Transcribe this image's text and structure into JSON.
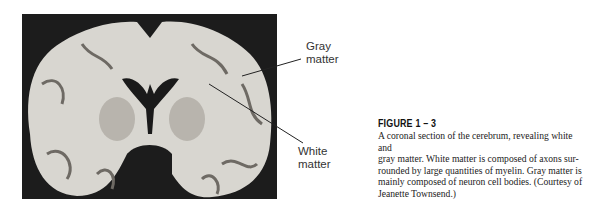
{
  "figure": {
    "image_alt": "Coronal section of the cerebrum",
    "labels": {
      "gray_matter": [
        "Gray",
        "matter"
      ],
      "white_matter": [
        "White",
        "matter"
      ]
    },
    "caption_title": "FIGURE 1 – 3",
    "caption_lines": [
      "A coronal section of the cerebrum, revealing white and",
      "gray matter. White matter is composed of axons sur-",
      "rounded by large quantities of myelin. Gray matter is",
      "mainly composed of neuron cell bodies. (Courtesy of",
      "Jeanette Townsend.)"
    ]
  }
}
